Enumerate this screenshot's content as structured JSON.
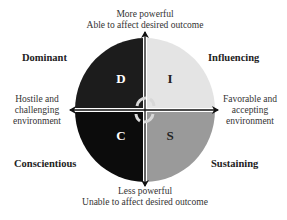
{
  "diagram": {
    "type": "DISC quadrant model",
    "top_label": [
      "More powerful",
      "Able to affect desired outcome"
    ],
    "bottom_label": [
      "Less powerful",
      "Unable to affect desired outcome"
    ],
    "left_label": [
      "Hostile and",
      "challenging",
      "environment"
    ],
    "right_label": [
      "Favorable and",
      "accepting",
      "environment"
    ],
    "quadrants": [
      {
        "letter": "D",
        "name": "Dominant",
        "position": "top-left",
        "color": "#1c1c1c",
        "letter_color": "#ffffff"
      },
      {
        "letter": "I",
        "name": "Influencing",
        "position": "top-right",
        "color": "#e4e4e4",
        "letter_color": "#222222"
      },
      {
        "letter": "C",
        "name": "Conscientious",
        "position": "bottom-left",
        "color": "#0c0c0c",
        "letter_color": "#ffffff"
      },
      {
        "letter": "S",
        "name": "Sustaining",
        "position": "bottom-right",
        "color": "#9a9a9a",
        "letter_color": "#222222"
      }
    ]
  }
}
